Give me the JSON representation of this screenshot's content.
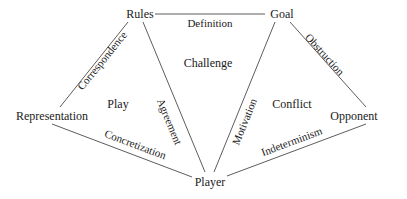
{
  "diagram": {
    "nodes": {
      "rules": "Rules",
      "goal": "Goal",
      "representation": "Representation",
      "opponent": "Opponent",
      "player": "Player"
    },
    "edges": {
      "rules_goal": "Definition",
      "rules_representation": "Correspondence",
      "rules_player": "Agreement",
      "goal_player": "Motivation",
      "goal_opponent": "Obstruction",
      "representation_player": "Concretization",
      "player_opponent": "Indeterminism"
    },
    "regions": {
      "top": "Challenge",
      "left": "Play",
      "right": "Conflict"
    },
    "colors": {
      "line": "#333333",
      "text": "#1a1a1a",
      "background": "#ffffff"
    }
  }
}
